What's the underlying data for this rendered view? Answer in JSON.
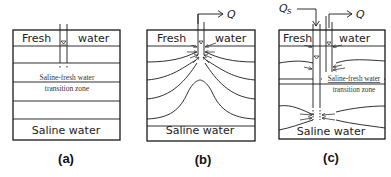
{
  "panels": [
    {
      "id": "a",
      "caption": "(a)",
      "top_label_left": "Fresh",
      "top_label_right": "water",
      "transition_label_line1": "Saline-fresh water",
      "transition_label_line2": "transition zone",
      "bottom_label": "Saline water"
    },
    {
      "id": "b",
      "caption": "(b)",
      "top_label_left": "Fresh",
      "top_label_right": "water",
      "bottom_label": "Saline water",
      "flow_label": "Q"
    },
    {
      "id": "c",
      "caption": "(c)",
      "top_label_left": "Fresh",
      "top_label_right": "water",
      "transition_label_line1": "Saline-fresh water",
      "transition_label_line2": "transition zone",
      "bottom_label": "Saline water",
      "flow_label": "Q",
      "inflow_label": "Q",
      "inflow_subscript": "S"
    }
  ],
  "colors": {
    "line": "#1a1a1a",
    "text": "#222222",
    "background": "#ffffff"
  }
}
